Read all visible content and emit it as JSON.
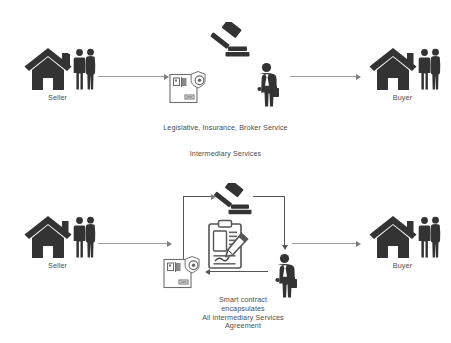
{
  "diagram": {
    "colors": {
      "icon_dark": "#333333",
      "icon_outline": "#555555",
      "arrow_gray": "#9d9d9d",
      "text_gray": "#4d4d4d",
      "background": "#ffffff"
    },
    "panels": [
      {
        "id": "traditional",
        "nodes": [
          {
            "id": "seller-top",
            "label": "Seller",
            "icons": [
              "house-icon",
              "couple-icon"
            ]
          },
          {
            "id": "gavel-top",
            "label": "",
            "icons": [
              "gavel-icon"
            ]
          },
          {
            "id": "insurance-doc-top",
            "label": "",
            "icons": [
              "insurance-document-icon"
            ]
          },
          {
            "id": "broker-top",
            "label": "",
            "icons": [
              "businessman-icon"
            ]
          },
          {
            "id": "buyer-top",
            "label": "Buyer",
            "icons": [
              "house-icon",
              "couple-icon"
            ]
          }
        ],
        "captions": [
          "Legislative, Insurance, Broker Service",
          "Intermediary Services"
        ],
        "arrows": [
          {
            "from": "seller-top",
            "to": "insurance-doc-top",
            "direction": "right"
          },
          {
            "from": "broker-top",
            "to": "buyer-top",
            "direction": "right"
          }
        ]
      },
      {
        "id": "smart-contract",
        "nodes": [
          {
            "id": "seller-bottom",
            "label": "Seller",
            "icons": [
              "house-icon",
              "couple-icon"
            ]
          },
          {
            "id": "gavel-bottom",
            "label": "",
            "icons": [
              "gavel-icon"
            ]
          },
          {
            "id": "clipboard-bottom",
            "label": "",
            "icons": [
              "clipboard-pen-icon"
            ]
          },
          {
            "id": "insurance-doc-bottom",
            "label": "",
            "icons": [
              "insurance-document-icon"
            ]
          },
          {
            "id": "broker-bottom",
            "label": "",
            "icons": [
              "businessman-icon"
            ]
          },
          {
            "id": "buyer-bottom",
            "label": "Buyer",
            "icons": [
              "house-icon",
              "couple-icon"
            ]
          }
        ],
        "caption_lines": [
          "Smart contract",
          "encapsulates",
          "All intermediary Services",
          "Agreement"
        ],
        "arrows": [
          {
            "from": "seller-bottom",
            "to": "smart-contract-group",
            "direction": "right"
          },
          {
            "from": "smart-contract-group",
            "to": "buyer-bottom",
            "direction": "right"
          },
          {
            "from": "insurance-doc-bottom",
            "to": "gavel-bottom",
            "direction": "up-right"
          },
          {
            "from": "gavel-bottom",
            "to": "broker-bottom",
            "direction": "right-down"
          },
          {
            "from": "broker-bottom",
            "to": "insurance-doc-bottom",
            "direction": "left"
          }
        ]
      }
    ]
  },
  "labels": {
    "seller_top": "Seller",
    "buyer_top": "Buyer",
    "seller_bottom": "Seller",
    "buyer_bottom": "Buyer",
    "intermediary_line1": "Legislative, Insurance, Broker Service",
    "intermediary_line2": "Intermediary Services",
    "smart_line1": "Smart contract",
    "smart_line2": "encapsulates",
    "smart_line3": "All intermediary Services",
    "smart_line4": "Agreement"
  }
}
